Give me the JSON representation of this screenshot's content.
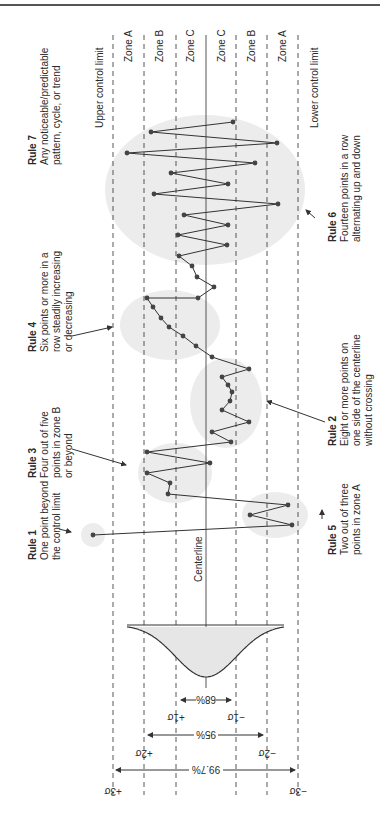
{
  "figure": {
    "orientation": "rotated -90deg (landscape page printed sideways)",
    "page_number_glyph": "8"
  },
  "limits": {
    "upper": "Upper control limit",
    "lower": "Lower control limit",
    "centerline": "Centerline"
  },
  "zones": [
    {
      "label": "Zone A",
      "x": 128
    },
    {
      "label": "Zone B",
      "x": 159
    },
    {
      "label": "Zone C",
      "x": 190
    },
    {
      "label": "Zone C",
      "x": 221
    },
    {
      "label": "Zone B",
      "x": 251
    },
    {
      "label": "Zone A",
      "x": 282
    }
  ],
  "gridlines": [
    {
      "name": "plus-3-sigma",
      "x": 113,
      "style": "dashed"
    },
    {
      "name": "plus-2-sigma",
      "x": 144,
      "style": "dashed"
    },
    {
      "name": "plus-1-sigma",
      "x": 176,
      "style": "dashed"
    },
    {
      "name": "centerline",
      "x": 206,
      "style": "solid"
    },
    {
      "name": "minus-1-sigma",
      "x": 236,
      "style": "dashed"
    },
    {
      "name": "minus-2-sigma",
      "x": 267,
      "style": "dashed"
    },
    {
      "name": "minus-3-sigma",
      "x": 298,
      "style": "dashed"
    }
  ],
  "sigma_labels": {
    "p3": "+3σ",
    "p2": "+2σ",
    "p1": "+1σ",
    "m1": "−1σ",
    "m2": "−2σ",
    "m3": "−3σ"
  },
  "coverage": {
    "one_sigma": "68%",
    "two_sigma": "95%",
    "three_sigma": "99.7%"
  },
  "rules": [
    {
      "id": "rule1",
      "title": "Rule 1",
      "lines": [
        "One point beyond",
        "the control limit"
      ]
    },
    {
      "id": "rule2",
      "title": "Rule 2",
      "lines": [
        "Eight or more points on",
        "one side of the centerline",
        "without crossing"
      ]
    },
    {
      "id": "rule3",
      "title": "Rule 3",
      "lines": [
        "Four out of five",
        "points in zone B",
        "or beyond"
      ]
    },
    {
      "id": "rule4",
      "title": "Rule 4",
      "lines": [
        "Six points or more in a",
        "row steadily increasing",
        "or decreasing"
      ]
    },
    {
      "id": "rule5",
      "title": "Rule 5",
      "lines": [
        "Two out of three",
        "points in zone A"
      ]
    },
    {
      "id": "rule6",
      "title": "Rule 6",
      "lines": [
        "Fourteen points in a row",
        "alternating up and down"
      ]
    },
    {
      "id": "rule7",
      "title": "Rule 7",
      "lines": [
        "Any noticeable/predictable",
        "pattern, cycle, or trend"
      ]
    }
  ],
  "highlight_regions": [
    {
      "rule": "rule7",
      "cx": 205,
      "cy": 190,
      "rx": 100,
      "ry": 75
    },
    {
      "rule": "rule4",
      "cx": 170,
      "cy": 325,
      "rx": 50,
      "ry": 35
    },
    {
      "rule": "rule2",
      "cx": 226,
      "cy": 403,
      "rx": 36,
      "ry": 45
    },
    {
      "rule": "rule3",
      "cx": 175,
      "cy": 473,
      "rx": 37,
      "ry": 30
    },
    {
      "rule": "rule5",
      "cx": 275,
      "cy": 515,
      "rx": 33,
      "ry": 23
    },
    {
      "rule": "rule1",
      "cx": 93,
      "cy": 535,
      "rx": 12,
      "ry": 12
    }
  ],
  "chart_data": {
    "type": "line",
    "xlabel": "Sample (time)",
    "ylabel": "Measurement (σ from centerline)",
    "ylim": [
      -3.5,
      3.5
    ],
    "y_ticks": [
      "+3σ",
      "+2σ",
      "+1σ",
      "0",
      "−1σ",
      "−2σ",
      "−3σ"
    ],
    "sigma_values_in_time_order": [
      3.7,
      -2.8,
      -1.4,
      -2.7,
      1.2,
      1.2,
      2.0,
      0.0,
      2.0,
      -0.8,
      0.2,
      -1.4,
      -0.5,
      -0.8,
      -0.3,
      -0.7,
      -1.4,
      -1.4,
      -0.2,
      0.5,
      0.8,
      1.2,
      1.5,
      1.8,
      2.0,
      1.9,
      0.3,
      -0.3,
      0.7,
      0.9,
      0.9,
      -0.7,
      0.9,
      -0.7,
      0.7,
      -1.4,
      0.0,
      -2.4,
      1.7,
      -2.2,
      2.6,
      -0.9,
      1.8,
      -0.9
    ],
    "points_image_coords": [
      [
        93,
        535
      ],
      [
        292,
        525
      ],
      [
        250,
        515
      ],
      [
        288,
        505
      ],
      [
        168,
        494
      ],
      [
        170,
        483
      ],
      [
        147,
        473
      ],
      [
        210,
        463
      ],
      [
        147,
        452
      ],
      [
        231,
        442
      ],
      [
        212,
        432
      ],
      [
        249,
        422
      ],
      [
        222,
        410
      ],
      [
        230,
        401
      ],
      [
        232,
        392
      ],
      [
        228,
        385
      ],
      [
        222,
        377
      ],
      [
        249,
        369
      ],
      [
        212,
        357
      ],
      [
        196,
        346
      ],
      [
        183,
        336
      ],
      [
        169,
        327
      ],
      [
        161,
        318
      ],
      [
        153,
        307
      ],
      [
        147,
        298
      ],
      [
        198,
        298
      ],
      [
        214,
        287
      ],
      [
        197,
        277
      ],
      [
        192,
        266
      ],
      [
        179,
        256
      ],
      [
        227,
        245
      ],
      [
        178,
        235
      ],
      [
        228,
        225
      ],
      [
        184,
        215
      ],
      [
        278,
        204
      ],
      [
        154,
        194
      ],
      [
        228,
        184
      ],
      [
        171,
        173
      ],
      [
        255,
        163
      ],
      [
        127,
        153
      ],
      [
        277,
        143
      ],
      [
        151,
        132
      ],
      [
        233,
        122
      ]
    ],
    "normal_curve": {
      "mean_x": 206,
      "sigma_px": 30.5,
      "baseline_y": 625,
      "peak_y": 677
    },
    "annotations": [
      "Rule 1",
      "Rule 2",
      "Rule 3",
      "Rule 4",
      "Rule 5",
      "Rule 6",
      "Rule 7",
      "Centerline",
      "Upper control limit",
      "Lower control limit"
    ]
  }
}
